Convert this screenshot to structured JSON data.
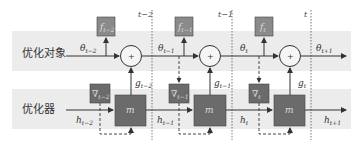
{
  "rows": {
    "objective_label": "优化对象",
    "optimizer_label": "优化器"
  },
  "timesteps": [
    {
      "label": "t−2"
    },
    {
      "label": "t−1"
    },
    {
      "label": "t"
    }
  ],
  "objective": {
    "theta": [
      {
        "base": "θ",
        "sub": "t−2"
      },
      {
        "base": "θ",
        "sub": "t−1"
      },
      {
        "base": "θ",
        "sub": "t"
      },
      {
        "base": "θ",
        "sub": "t+1"
      }
    ],
    "f_boxes": [
      {
        "base": "f",
        "sub": "t−2"
      },
      {
        "base": "f",
        "sub": "t−1"
      },
      {
        "base": "f",
        "sub": "t"
      }
    ],
    "sum_symbol": "+"
  },
  "optimizer": {
    "h": [
      {
        "base": "h",
        "sub": "t−2"
      },
      {
        "base": "h",
        "sub": "t−1"
      },
      {
        "base": "h",
        "sub": "t"
      },
      {
        "base": "h",
        "sub": "t+1"
      }
    ],
    "grad_boxes": [
      {
        "base": "∇",
        "sub": "t−2"
      },
      {
        "base": "∇",
        "sub": "t−1"
      },
      {
        "base": "∇",
        "sub": "t"
      }
    ],
    "g": [
      {
        "base": "g",
        "sub": "t−2"
      },
      {
        "base": "g",
        "sub": "t−1"
      },
      {
        "base": "g",
        "sub": "t"
      }
    ],
    "m_label": "m"
  },
  "colors": {
    "band": "#ececec",
    "box_fill": "#6b6b6b",
    "f_box_fill": "#8a8a8a",
    "line": "#333333"
  }
}
